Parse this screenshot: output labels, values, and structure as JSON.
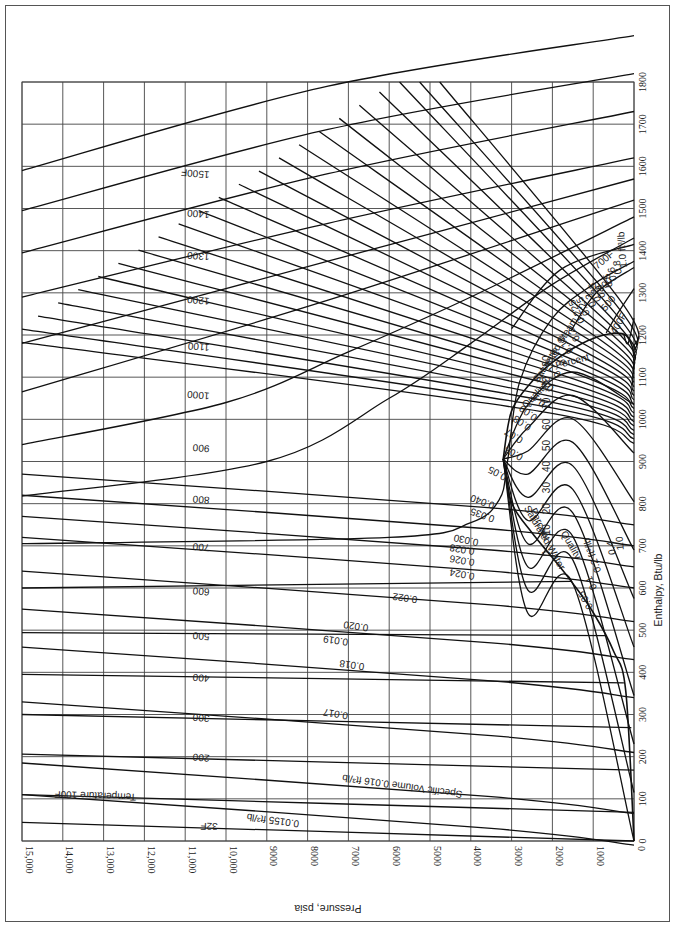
{
  "chart_data": {
    "type": "line",
    "xlabel": "Pressure, psia",
    "ylabel": "Enthalpy, Btu/lb",
    "orientation": "rotated: pressure axis along bottom (15,000 at left to 0 at right), enthalpy axis along right (0 at bottom to 1800 at top)",
    "xlim": [
      0,
      15000
    ],
    "ylim": [
      0,
      1800
    ],
    "grid": true,
    "pressure_ticks": [
      "15,000",
      "14,000",
      "13,000",
      "12,000",
      "11,000",
      "10,000",
      "9000",
      "8000",
      "7000",
      "6000",
      "5000",
      "4000",
      "3000",
      "2000",
      "1000",
      "0"
    ],
    "pressure_tick_values": [
      15000,
      14000,
      13000,
      12000,
      11000,
      10000,
      9000,
      8000,
      7000,
      6000,
      5000,
      4000,
      3000,
      2000,
      1000,
      0
    ],
    "enthalpy_ticks": [
      "0",
      "100",
      "200",
      "300",
      "400",
      "500",
      "600",
      "700",
      "800",
      "900",
      "1000",
      "1100",
      "1200",
      "1300",
      "1400",
      "1500",
      "1600",
      "1700",
      "1800"
    ],
    "enthalpy_tick_values": [
      0,
      100,
      200,
      300,
      400,
      500,
      600,
      700,
      800,
      900,
      1000,
      1100,
      1200,
      1300,
      1400,
      1500,
      1600,
      1700,
      1800
    ],
    "saturation_dome": {
      "critical_point": {
        "pressure": 3206,
        "enthalpy": 906
      },
      "saturated_water_label": "Saturated Water",
      "saturated_steam_label": "Saturated Steam",
      "saturated_water": [
        [
          0,
          0
        ],
        [
          200,
          355
        ],
        [
          500,
          450
        ],
        [
          1000,
          542
        ],
        [
          1500,
          611
        ],
        [
          2000,
          672
        ],
        [
          2500,
          731
        ],
        [
          3000,
          802
        ],
        [
          3206,
          906
        ]
      ],
      "saturated_steam": [
        [
          3206,
          906
        ],
        [
          3000,
          1020
        ],
        [
          2500,
          1090
        ],
        [
          2000,
          1135
        ],
        [
          1500,
          1168
        ],
        [
          1000,
          1192
        ],
        [
          500,
          1204
        ],
        [
          200,
          1199
        ],
        [
          50,
          1174
        ],
        [
          0,
          1150
        ]
      ]
    },
    "temperature_lines_F": [
      {
        "label": "32F",
        "value": 32,
        "h_at_15000": 44,
        "h_at_0": 0
      },
      {
        "label": "Temperature 100F",
        "value": 100,
        "h_at_15000": 110,
        "h_at_0": 68
      },
      {
        "label": "200",
        "value": 200,
        "h_at_15000": 206,
        "h_at_0": 168
      },
      {
        "label": "300",
        "value": 300,
        "h_at_15000": 300,
        "h_at_0": 269
      },
      {
        "label": "400",
        "value": 400,
        "h_at_15000": 395,
        "h_at_0": 375
      },
      {
        "label": "500",
        "value": 500,
        "h_at_15000": 494,
        "h_at_0": 487
      },
      {
        "label": "600",
        "value": 600,
        "h_at_15000": 600,
        "h_at_0": 616
      },
      {
        "label": "700",
        "value": 700,
        "h_at_15000": 705,
        "h_at_0": 712
      },
      {
        "label": "800",
        "value": 800,
        "h_at_15000": 818,
        "h_at_0": 1000
      },
      {
        "label": "900",
        "value": 900,
        "h_at_15000": 940,
        "h_at_0": 1200
      },
      {
        "label": "1000",
        "value": 1000,
        "h_at_15000": 1065,
        "h_at_0": 1260
      },
      {
        "label": "1100",
        "value": 1100,
        "h_at_15000": 1180,
        "h_at_0": 1320
      },
      {
        "label": "1200",
        "value": 1200,
        "h_at_15000": 1290,
        "h_at_0": 1380
      },
      {
        "label": "1300",
        "value": 1300,
        "h_at_15000": 1395,
        "h_at_0": 1500
      },
      {
        "label": "1400",
        "value": 1400,
        "h_at_15000": 1495,
        "h_at_0": 1600
      },
      {
        "label": "1500F",
        "value": 1500,
        "h_at_15000": 1590,
        "h_at_0": 1700
      }
    ],
    "superheat_temperature_labels": [
      "400F",
      "500",
      "600",
      "700F"
    ],
    "specific_volume_lines_ft3_per_lb": [
      {
        "label": "0.0155 ft³/lb",
        "value": 0.0155
      },
      {
        "label": "Specific Volume  0.016 ft³/lb",
        "value": 0.016
      },
      {
        "label": "0.017",
        "value": 0.017
      },
      {
        "label": "0.018",
        "value": 0.018
      },
      {
        "label": "0.019",
        "value": 0.019
      },
      {
        "label": "0.020",
        "value": 0.02
      },
      {
        "label": "0.022",
        "value": 0.022
      },
      {
        "label": "0.024",
        "value": 0.024
      },
      {
        "label": "0.026",
        "value": 0.026
      },
      {
        "label": "0.028",
        "value": 0.028
      },
      {
        "label": "0.030",
        "value": 0.03
      },
      {
        "label": "0.035",
        "value": 0.035
      },
      {
        "label": "0.040",
        "value": 0.04
      },
      {
        "label": "0.05",
        "value": 0.05
      },
      {
        "label": "0.06",
        "value": 0.06
      },
      {
        "label": "0.07",
        "value": 0.07
      },
      {
        "label": "0.08",
        "value": 0.08
      },
      {
        "label": "0.09",
        "value": 0.09
      },
      {
        "label": "0.1",
        "value": 0.1
      },
      {
        "label": "0.12",
        "value": 0.12
      },
      {
        "label": "0.14",
        "value": 0.14
      },
      {
        "label": "0.16",
        "value": 0.16
      },
      {
        "label": "0.18",
        "value": 0.18
      },
      {
        "label": "0.2",
        "value": 0.2
      },
      {
        "label": "0.225",
        "value": 0.225
      },
      {
        "label": "0.25",
        "value": 0.25
      },
      {
        "label": "0.3",
        "value": 0.3
      },
      {
        "label": "0.35",
        "value": 0.35
      },
      {
        "label": "0.4",
        "value": 0.4
      },
      {
        "label": "0.5",
        "value": 0.5
      },
      {
        "label": "0.6",
        "value": 0.6
      },
      {
        "label": "0.8",
        "value": 0.8
      },
      {
        "label": "1.0 ft³/lb",
        "value": 1.0
      }
    ],
    "wet_region_volume_labels": [
      "0.05",
      "0.1",
      "0.2 ft³/lb",
      "0.4",
      "1.0"
    ],
    "quality_lines_percent": {
      "labels": [
        "0",
        "10",
        "20",
        "30",
        "40",
        "50",
        "60",
        "70",
        "80",
        "90"
      ],
      "title_upper": "Quality  Percent",
      "title_lower": "Quality  Percent"
    }
  },
  "labels": {
    "pressure_axis_title": "Pressure, psia",
    "enthalpy_axis_title": "Enthalpy, Btu/lb",
    "saturated_water": "Saturated Water",
    "saturated_steam": "Saturated Steam",
    "quality_upper": "Quality",
    "percent_upper": "Percent",
    "quality_lower": "Quality",
    "percent_lower": "Percent",
    "temp_32": "32F",
    "temp_100": "Temperature 100F",
    "vol_00155": "0.0155 ft³/lb",
    "vol_0016": "Specific Volume  0.016 ft³/lb",
    "t400f": "400F",
    "t500": "500",
    "t600": "600",
    "t700f": "700F"
  }
}
